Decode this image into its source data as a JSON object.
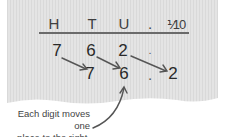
{
  "headers": [
    "H",
    "T",
    "U",
    ".",
    "1/10"
  ],
  "headers_display": {
    "h": "H",
    "t": "T",
    "u": "U",
    "point": ".",
    "tenths": "⅟10"
  },
  "row_before": {
    "hundreds": "7",
    "tens": "6",
    "units": "2",
    "point": "."
  },
  "row_after": {
    "tens": "7",
    "units": "6",
    "point": ".",
    "tenths": "2"
  },
  "caption": {
    "line1": "Each digit moves one",
    "line2": "place to the right."
  },
  "colors": {
    "paper": "#e6e6e6",
    "text": "#2a2a2a",
    "arrow": "#555555",
    "rule": "#6a6a6a"
  }
}
